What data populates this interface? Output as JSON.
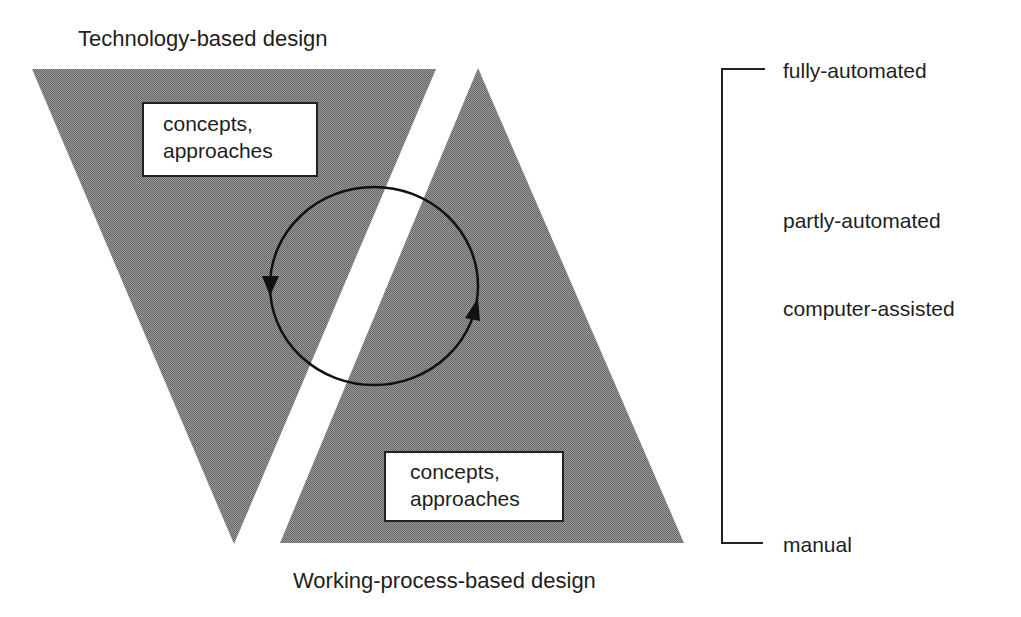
{
  "diagram": {
    "top_title": "Technology-based design",
    "bottom_title": "Working-process-based design",
    "top_box": {
      "line1": "concepts,",
      "line2": "approaches"
    },
    "bottom_box": {
      "line1": "concepts,",
      "line2": "approaches"
    },
    "scale": {
      "levels": [
        "fully-automated",
        "partly-automated",
        "computer-assisted",
        "manual"
      ]
    },
    "cycle": {
      "description": "circular feedback loop",
      "arrows": [
        "down-left",
        "up-right"
      ]
    },
    "colors": {
      "fill": "#7f7f7f",
      "stroke": "#111111",
      "background": "#ffffff"
    }
  }
}
